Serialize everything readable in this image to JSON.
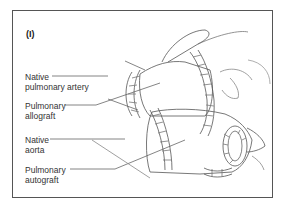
{
  "figure": {
    "panel_label": "(I)",
    "labels": [
      {
        "id": "native-pulmonary-artery",
        "line1": "Native",
        "line2": "pulmonary artery"
      },
      {
        "id": "pulmonary-allograft",
        "line1": "Pulmonary",
        "line2": "allograft"
      },
      {
        "id": "native-aorta",
        "line1": "Native",
        "line2": "aorta"
      },
      {
        "id": "pulmonary-autograft",
        "line1": "Pulmonary",
        "line2": "autograft"
      }
    ]
  }
}
